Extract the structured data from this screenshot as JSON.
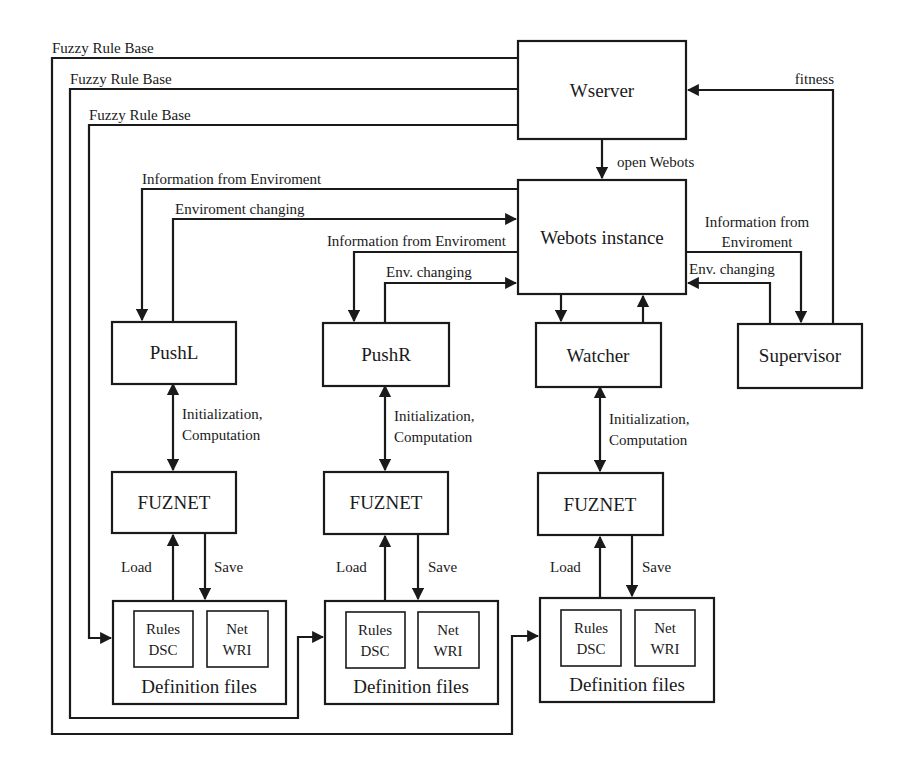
{
  "nodes": {
    "wserver": {
      "label": "Wserver"
    },
    "webots": {
      "label": "Webots instance"
    },
    "pushl": {
      "label": "PushL"
    },
    "pushr": {
      "label": "PushR"
    },
    "watcher": {
      "label": "Watcher"
    },
    "supervisor": {
      "label": "Supervisor"
    },
    "fuznet_l": {
      "label": "FUZNET"
    },
    "fuznet_r": {
      "label": "FUZNET"
    },
    "fuznet_w": {
      "label": "FUZNET"
    },
    "def_l": {
      "label": "Definition files",
      "rules": [
        "Rules",
        "DSC"
      ],
      "net": [
        "Net",
        "WRI"
      ]
    },
    "def_r": {
      "label": "Definition files",
      "rules": [
        "Rules",
        "DSC"
      ],
      "net": [
        "Net",
        "WRI"
      ]
    },
    "def_w": {
      "label": "Definition files",
      "rules": [
        "Rules",
        "DSC"
      ],
      "net": [
        "Net",
        "WRI"
      ]
    }
  },
  "edges": {
    "frb1": "Fuzzy Rule Base",
    "frb2": "Fuzzy Rule Base",
    "frb3": "Fuzzy Rule Base",
    "fitness": "fitness",
    "open_webots": "open Webots",
    "info_l": "Information from Enviroment",
    "env_l": "Enviroment changing",
    "info_r": "Information from Enviroment",
    "env_r": "Env. changing",
    "info_s": [
      "Information from",
      "Enviroment"
    ],
    "env_s": "Env. changing",
    "init_l": [
      "Initialization,",
      "Computation"
    ],
    "init_r": [
      "Initialization,",
      "Computation"
    ],
    "init_w": [
      "Initialization,",
      "Computation"
    ],
    "load_l": "Load",
    "save_l": "Save",
    "load_r": "Load",
    "save_r": "Save",
    "load_w": "Load",
    "save_w": "Save"
  }
}
